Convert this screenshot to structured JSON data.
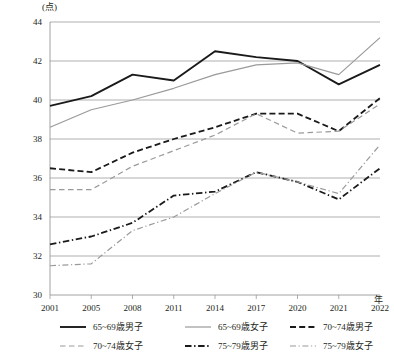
{
  "chart_data": {
    "type": "line",
    "title": "",
    "unit_label": "(点)",
    "xlabel": "年",
    "ylabel": "",
    "categories": [
      "2001",
      "2005",
      "2008",
      "2011",
      "2014",
      "2017",
      "2020",
      "2021",
      "2022"
    ],
    "ylim": [
      30,
      44
    ],
    "yticks": [
      30,
      32,
      34,
      36,
      38,
      40,
      42,
      44
    ],
    "ytick_labels": [
      "30",
      "32",
      "34",
      "36",
      "38",
      "40",
      "42",
      "44"
    ],
    "grid": true,
    "legend_position": "bottom",
    "series": [
      {
        "name": "65~69歳男子",
        "style": "solid",
        "color": "#1a1a1a",
        "width": 1.9,
        "values": [
          39.7,
          40.2,
          41.3,
          41.0,
          42.5,
          42.2,
          42.0,
          40.8,
          41.8
        ]
      },
      {
        "name": "65~69歳女子",
        "style": "solid",
        "color": "#9a9a9a",
        "width": 1.2,
        "values": [
          38.6,
          39.5,
          40.0,
          40.6,
          41.3,
          41.8,
          41.9,
          41.3,
          43.2
        ]
      },
      {
        "name": "70~74歳男子",
        "style": "dashed",
        "color": "#1a1a1a",
        "width": 1.8,
        "values": [
          36.5,
          36.3,
          37.3,
          38.0,
          38.6,
          39.3,
          39.3,
          38.4,
          40.1
        ]
      },
      {
        "name": "70~74歳女子",
        "style": "dashed",
        "color": "#9a9a9a",
        "width": 1.2,
        "values": [
          35.4,
          35.4,
          36.6,
          37.4,
          38.2,
          39.3,
          38.3,
          38.4,
          39.8
        ]
      },
      {
        "name": "75~79歳男子",
        "style": "dashdot",
        "color": "#1a1a1a",
        "width": 1.8,
        "values": [
          32.6,
          33.0,
          33.7,
          35.1,
          35.3,
          36.3,
          35.8,
          34.9,
          36.5
        ]
      },
      {
        "name": "75~79歳女子",
        "style": "dashdot",
        "color": "#9a9a9a",
        "width": 1.2,
        "values": [
          31.5,
          31.6,
          33.3,
          34.0,
          35.2,
          36.3,
          35.8,
          35.2,
          37.7
        ]
      }
    ]
  },
  "legend": {
    "rows": [
      [
        "65~69歳男子",
        "65~69歳女子",
        "70~74歳男子"
      ],
      [
        "70~74歳女子",
        "75~79歳男子",
        "75~79歳女子"
      ]
    ]
  }
}
